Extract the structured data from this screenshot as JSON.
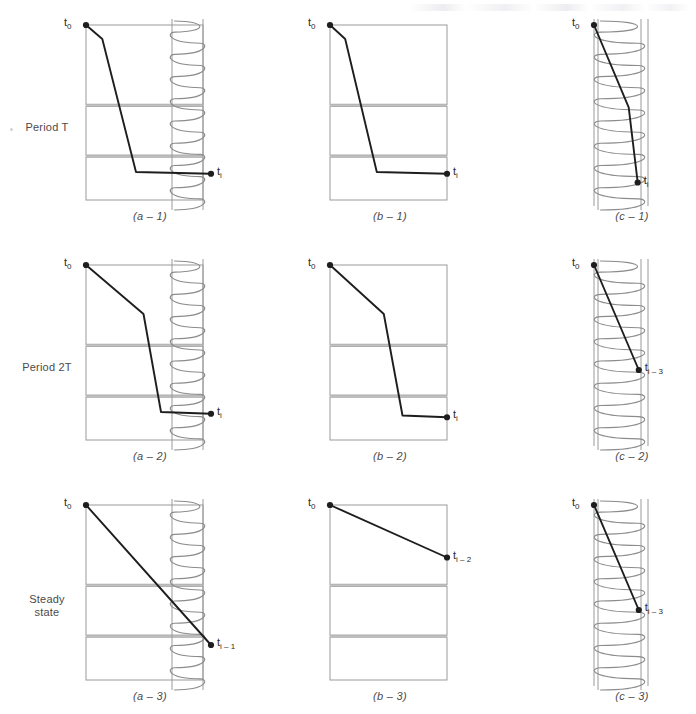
{
  "figure": {
    "width": 696,
    "height": 714,
    "background": "#ffffff",
    "line_color": "#1e1e1e",
    "wall_color": "#9a9a9a",
    "layer_fill_color": "#b9b9b9",
    "coil_color": "#8c8c8c"
  },
  "row_labels": [
    {
      "id": "period-t",
      "text": "Period T",
      "lines": [
        "Period T"
      ],
      "y": 128
    },
    {
      "id": "period-2t",
      "text": "Period 2T",
      "lines": [
        "Period 2T"
      ],
      "y": 368
    },
    {
      "id": "steady-state",
      "text": "Steady state",
      "lines": [
        "Steady",
        "state"
      ],
      "y": 600
    }
  ],
  "captions": [
    {
      "id": "a-1",
      "text": "(a – 1)"
    },
    {
      "id": "b-1",
      "text": "(b – 1)"
    },
    {
      "id": "c-1",
      "text": "(c – 1)"
    },
    {
      "id": "a-2",
      "text": "(a – 2)"
    },
    {
      "id": "b-2",
      "text": "(b – 2)"
    },
    {
      "id": "c-2",
      "text": "(c – 2)"
    },
    {
      "id": "a-3",
      "text": "(a – 3)"
    },
    {
      "id": "b-3",
      "text": "(b – 3)"
    },
    {
      "id": "c-3",
      "text": "(c – 3)"
    }
  ],
  "temperature_labels": {
    "start": {
      "base": "t",
      "sub": "0",
      "full": "t0"
    },
    "end_i": {
      "base": "t",
      "sub": "i",
      "full": "ti"
    },
    "end_i_1": {
      "base": "t",
      "sub": "i – 1",
      "full": "ti-1"
    },
    "end_i_2": {
      "base": "t",
      "sub": "i – 2",
      "full": "ti-2"
    },
    "end_i_3": {
      "base": "t",
      "sub": "i – 3",
      "full": "ti-3"
    }
  },
  "chart_data": {
    "type": "line",
    "xlabel": "",
    "ylabel": "temperature",
    "grid": false,
    "legend": false,
    "panels": [
      {
        "id": "a-1",
        "row": "Period T",
        "column": "a",
        "caption": "(a – 1)",
        "start_label": "t0",
        "end_label": "ti",
        "has_coil": true,
        "coil_side": "right",
        "layers": 3,
        "profile_shape": "steep-drop-then-flat",
        "points": [
          [
            0.0,
            1.0
          ],
          [
            0.13,
            0.92
          ],
          [
            0.4,
            0.16
          ],
          [
            1.0,
            0.15
          ]
        ]
      },
      {
        "id": "b-1",
        "row": "Period T",
        "column": "b",
        "caption": "(b – 1)",
        "start_label": "t0",
        "end_label": "ti",
        "has_coil": false,
        "coil_side": "none",
        "layers": 3,
        "profile_shape": "steep-drop-then-flat",
        "points": [
          [
            0.0,
            1.0
          ],
          [
            0.13,
            0.92
          ],
          [
            0.4,
            0.16
          ],
          [
            1.0,
            0.15
          ]
        ]
      },
      {
        "id": "c-1",
        "row": "Period T",
        "column": "c",
        "caption": "(c – 1)",
        "start_label": "t0",
        "end_label": "ti",
        "has_coil": true,
        "coil_side": "fill",
        "layers": 1,
        "profile_shape": "diagonal-then-steep",
        "points": [
          [
            0.0,
            1.0
          ],
          [
            0.62,
            0.53
          ],
          [
            0.78,
            0.1
          ]
        ]
      },
      {
        "id": "a-2",
        "row": "Period 2T",
        "column": "a",
        "caption": "(a – 2)",
        "start_label": "t0",
        "end_label": "ti",
        "has_coil": true,
        "coil_side": "right",
        "layers": 3,
        "profile_shape": "gentle-then-steep-then-flat",
        "points": [
          [
            0.0,
            1.0
          ],
          [
            0.46,
            0.72
          ],
          [
            0.6,
            0.16
          ],
          [
            1.0,
            0.15
          ]
        ]
      },
      {
        "id": "b-2",
        "row": "Period 2T",
        "column": "b",
        "caption": "(b – 2)",
        "start_label": "t0",
        "end_label": "ti",
        "has_coil": false,
        "coil_side": "none",
        "layers": 3,
        "profile_shape": "gentle-then-steep-then-flat",
        "points": [
          [
            0.0,
            1.0
          ],
          [
            0.46,
            0.72
          ],
          [
            0.62,
            0.14
          ],
          [
            1.0,
            0.13
          ]
        ]
      },
      {
        "id": "c-2",
        "row": "Period 2T",
        "column": "c",
        "caption": "(c – 2)",
        "start_label": "t0",
        "end_label": "ti-3",
        "has_coil": true,
        "coil_side": "fill",
        "layers": 1,
        "profile_shape": "straight-diagonal",
        "points": [
          [
            0.0,
            1.0
          ],
          [
            0.8,
            0.4
          ]
        ]
      },
      {
        "id": "a-3",
        "row": "Steady state",
        "column": "a",
        "caption": "(a – 3)",
        "start_label": "t0",
        "end_label": "ti-1",
        "has_coil": true,
        "coil_side": "right",
        "layers": 3,
        "profile_shape": "straight-diagonal",
        "points": [
          [
            0.0,
            1.0
          ],
          [
            1.0,
            0.2
          ]
        ]
      },
      {
        "id": "b-3",
        "row": "Steady state",
        "column": "b",
        "caption": "(b – 3)",
        "start_label": "t0",
        "end_label": "ti-2",
        "has_coil": false,
        "coil_side": "none",
        "layers": 3,
        "profile_shape": "straight-diagonal",
        "points": [
          [
            0.0,
            1.0
          ],
          [
            1.0,
            0.7
          ]
        ]
      },
      {
        "id": "c-3",
        "row": "Steady state",
        "column": "c",
        "caption": "(c – 3)",
        "start_label": "t0",
        "end_label": "ti-3",
        "has_coil": true,
        "coil_side": "fill",
        "layers": 1,
        "profile_shape": "straight-diagonal",
        "points": [
          [
            0.0,
            1.0
          ],
          [
            0.8,
            0.4
          ]
        ]
      }
    ]
  }
}
